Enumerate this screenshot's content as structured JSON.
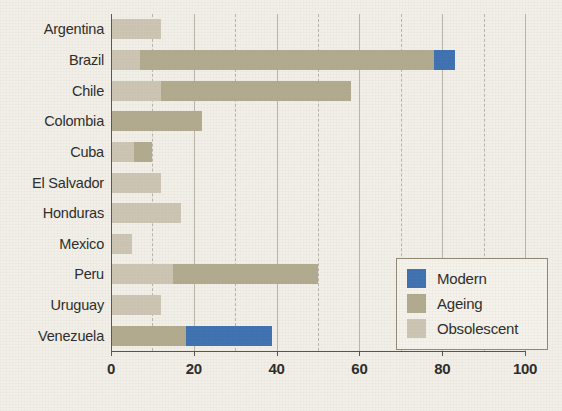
{
  "chart_data": {
    "type": "bar",
    "orientation": "horizontal",
    "stacked": true,
    "title": "",
    "xlabel": "",
    "ylabel": "",
    "xlim": [
      0,
      100
    ],
    "xticks": [
      0,
      20,
      40,
      60,
      80,
      100
    ],
    "xtick_labels": [
      "0",
      "20",
      "40",
      "60",
      "80",
      "100"
    ],
    "minor_gridlines": [
      10,
      30,
      50,
      70,
      90
    ],
    "grid": true,
    "legend_position": "lower right",
    "categories": [
      "Argentina",
      "Brazil",
      "Chile",
      "Colombia",
      "Cuba",
      "El Salvador",
      "Honduras",
      "Mexico",
      "Peru",
      "Uruguay",
      "Venezuela"
    ],
    "series": [
      {
        "name": "Modern",
        "color": "#3d71b2",
        "values": [
          0,
          5,
          0,
          0,
          0,
          0,
          0,
          0,
          0,
          0,
          21
        ]
      },
      {
        "name": "Ageing",
        "color": "#b2aa8f",
        "values": [
          0,
          71,
          46,
          22,
          4.5,
          0,
          0,
          0,
          35,
          0,
          18
        ]
      },
      {
        "name": "Obsolescent",
        "color": "#cdc5b3",
        "values": [
          12,
          7,
          12,
          0,
          5.5,
          12,
          17,
          5,
          15,
          12,
          0
        ]
      }
    ],
    "segment_order": [
      "Obsolescent",
      "Ageing",
      "Modern"
    ],
    "totals": [
      12,
      83,
      58,
      22,
      10,
      12,
      17,
      5,
      50,
      12,
      39
    ]
  },
  "legend": {
    "items": [
      {
        "label": "Modern",
        "color": "#3d71b2"
      },
      {
        "label": "Ageing",
        "color": "#b2aa8f"
      },
      {
        "label": "Obsolescent",
        "color": "#cdc5b3"
      }
    ]
  }
}
